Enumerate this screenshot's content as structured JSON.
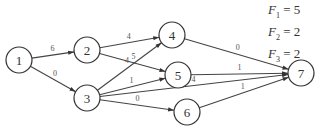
{
  "diagram": {
    "type": "directed-network",
    "nodes": [
      {
        "id": "1",
        "label": "1",
        "x": 19,
        "y": 60
      },
      {
        "id": "2",
        "label": "2",
        "x": 87,
        "y": 50
      },
      {
        "id": "3",
        "label": "3",
        "x": 87,
        "y": 98
      },
      {
        "id": "4",
        "label": "4",
        "x": 172,
        "y": 35
      },
      {
        "id": "5",
        "label": "5",
        "x": 178,
        "y": 75
      },
      {
        "id": "6",
        "label": "6",
        "x": 187,
        "y": 112
      },
      {
        "id": "7",
        "label": "7",
        "x": 301,
        "y": 73
      }
    ],
    "edges": [
      {
        "from": "1",
        "to": "2",
        "label": "6"
      },
      {
        "from": "1",
        "to": "3",
        "label": "0"
      },
      {
        "from": "2",
        "to": "4",
        "label": "4"
      },
      {
        "from": "2",
        "to": "5",
        "label": "5"
      },
      {
        "from": "3",
        "to": "4",
        "label": "4"
      },
      {
        "from": "3",
        "to": "5",
        "label": "1"
      },
      {
        "from": "3",
        "to": "7",
        "label": "4"
      },
      {
        "from": "3",
        "to": "6",
        "label": "0"
      },
      {
        "from": "4",
        "to": "7",
        "label": "0"
      },
      {
        "from": "5",
        "to": "7",
        "label": "1"
      },
      {
        "from": "6",
        "to": "7",
        "label": "1"
      }
    ]
  },
  "formulas": [
    {
      "var": "F",
      "sub": "1",
      "value": "5"
    },
    {
      "var": "F",
      "sub": "2",
      "value": "2"
    },
    {
      "var": "F",
      "sub": "3",
      "value": "2"
    }
  ]
}
